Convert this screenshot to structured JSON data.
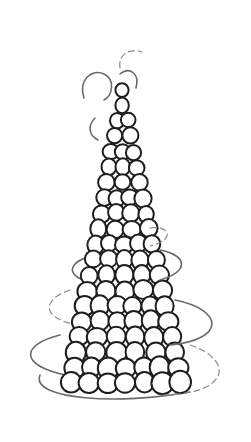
{
  "image": {
    "subject": "sketch of a conical tower of stacked round balls (croquembouche) wrapped in loose spiral strands",
    "width": 251,
    "height": 442,
    "colors": {
      "background": "#ffffff",
      "ball_outline": "#1e1e1e",
      "spiral": "#6a6a6a"
    }
  },
  "tower": {
    "apex_x": 122,
    "apex_y": 90,
    "base_y": 383,
    "base_left": 62,
    "base_right": 190,
    "rows": 20
  },
  "spirals": [
    "M84,98 C78,80 92,68 104,74 C116,80 112,96 104,100",
    "M120,68 C118,55 128,48 142,52",
    "M120,74 C130,66 140,74 136,88",
    "M95,118 C88,125 88,135 98,140",
    "M150,228 C170,225 176,240 150,246",
    "M96,255 C70,260 62,275 90,282",
    "M160,250 C185,255 192,270 160,280",
    "M70,290 C40,300 42,320 80,325",
    "M175,300 C225,310 225,340 170,345",
    "M60,335 C20,345 20,365 65,375",
    "M190,345 C235,360 230,395 160,395",
    "M40,375 C30,400 120,405 190,392"
  ]
}
